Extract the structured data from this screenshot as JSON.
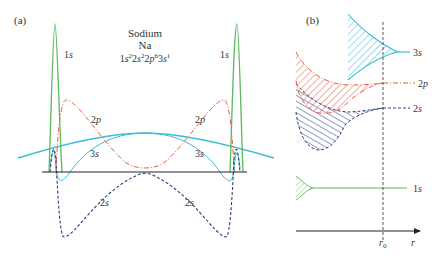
{
  "panel_a": {
    "label": "(a)",
    "title": "Sodium",
    "symbol": "Na",
    "config": {
      "parts": [
        "1",
        "s",
        "2",
        "2",
        "s",
        "2",
        "2",
        "p",
        "6",
        "3",
        "s",
        "1"
      ]
    },
    "curve_labels": {
      "1s_left": {
        "n": "1",
        "l": "s"
      },
      "1s_right": {
        "n": "1",
        "l": "s"
      },
      "2p_left": {
        "n": "2",
        "l": "p"
      },
      "2p_right": {
        "n": "2",
        "l": "p"
      },
      "3s_left": {
        "n": "3",
        "l": "s"
      },
      "3s_right": {
        "n": "3",
        "l": "s"
      },
      "2s_left": {
        "n": "2",
        "l": "s"
      },
      "2s_right": {
        "n": "2",
        "l": "s"
      }
    }
  },
  "panel_b": {
    "label": "(b)",
    "bands": [
      {
        "n": "3",
        "l": "s"
      },
      {
        "n": "2",
        "l": "p"
      },
      {
        "n": "2",
        "l": "s"
      },
      {
        "n": "1",
        "l": "s"
      }
    ],
    "axis": {
      "r0_main": "r",
      "r0_sub": "0",
      "r": "r"
    }
  },
  "colors": {
    "1s": "#5bb85b",
    "2s": "#2c3f7a",
    "2p": "#e0604a",
    "3s": "#3cbcd6",
    "axis": "#222222"
  }
}
